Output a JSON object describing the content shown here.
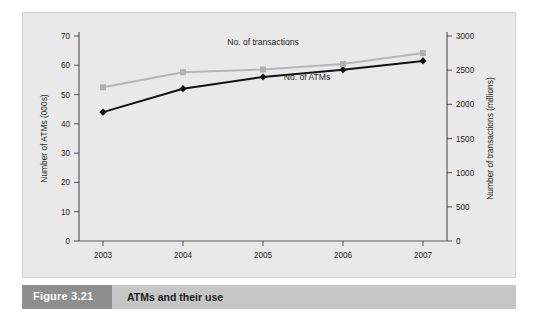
{
  "figure": {
    "number_label": "Figure 3.21",
    "caption": "ATMs and their use"
  },
  "colors": {
    "panel_background": "#e9e9e9",
    "caption_bar": "#c6c6c6",
    "caption_number_box": "#8e8e8e",
    "atms_series": "#121212",
    "transactions_series": "#b6b6b6",
    "axis": "#5a5a5a"
  },
  "chart_data": {
    "type": "line",
    "title": "",
    "xlabel": "",
    "ylabel": "Number of ATMs (000s)",
    "y2label": "Number of transactions (millions)",
    "grid": false,
    "legend_position": "inline-annotations",
    "categories": [
      "2003",
      "2004",
      "2005",
      "2006",
      "2007"
    ],
    "x": [
      2003,
      2004,
      2005,
      2006,
      2007
    ],
    "ylim": [
      0,
      70
    ],
    "y2lim": [
      0,
      3000
    ],
    "yticks": [
      0,
      10,
      20,
      30,
      40,
      50,
      60,
      70
    ],
    "ytick_labels": [
      "0",
      "10",
      "20",
      "30",
      "40",
      "50",
      "60",
      "70"
    ],
    "y2ticks": [
      0,
      500,
      1000,
      1500,
      2000,
      2500,
      3000
    ],
    "y2tick_labels": [
      "0",
      "500",
      "1000",
      "1500",
      "2000",
      "2500",
      "3000"
    ],
    "series": [
      {
        "name": "No. of ATMs",
        "axis": "left",
        "color": "#121212",
        "marker": "diamond",
        "values": [
          44,
          52,
          56,
          58.5,
          61.5
        ]
      },
      {
        "name": "No. of transactions",
        "axis": "right",
        "color": "#b6b6b6",
        "marker": "square",
        "values": [
          2250,
          2470,
          2510,
          2590,
          2750
        ]
      }
    ],
    "annotations": [
      {
        "text": "No. of transactions",
        "x": 2005.0,
        "y_axis": "right",
        "y": 2870
      },
      {
        "text": "No. of ATMs",
        "x": 2005.55,
        "y_axis": "left",
        "y": 55.0
      }
    ]
  }
}
